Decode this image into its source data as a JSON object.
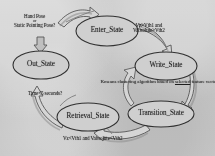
{
  "diagram": {
    "states": [
      {
        "id": "enter",
        "label": "Enter_State",
        "cx": 107,
        "cy": 31,
        "rx": 31,
        "ry": 15
      },
      {
        "id": "write",
        "label": "Write_State",
        "cx": 166,
        "cy": 66,
        "rx": 31,
        "ry": 14
      },
      {
        "id": "transition",
        "label": "Transition_State",
        "cx": 161,
        "cy": 114,
        "rx": 33,
        "ry": 13
      },
      {
        "id": "retrieval",
        "label": "Retrieval_State",
        "cx": 88,
        "cy": 117,
        "rx": 31,
        "ry": 14
      },
      {
        "id": "out",
        "label": "Out_State",
        "cx": 41,
        "cy": 65,
        "rx": 28,
        "ry": 14
      }
    ],
    "conditions": [
      {
        "id": "hand-pose",
        "lines": [
          "Hand Pose",
          "or",
          "Static Pointing Pose?"
        ],
        "x": 14,
        "y": 14
      },
      {
        "id": "enter-to-write",
        "lines": [
          "Vz>Vth1 and",
          "Vabsolute>Vth2"
        ],
        "x": 133,
        "y": 23
      },
      {
        "id": "time-out",
        "lines": [
          "Time<5 seconds?"
        ],
        "x": 28,
        "y": 91
      },
      {
        "id": "back-to-out",
        "lines": [
          "Vz<Vth1 and Vabsolute<Vth2"
        ],
        "x": 63,
        "y": 136
      }
    ],
    "inner_note": {
      "id": "kmeans-note",
      "line1": "Kmeans clustering algorithm",
      "line2_pre": "based on ",
      "line2_underlined": "selected",
      "line2_post": " feature vectors",
      "x": 160,
      "y": 78
    },
    "colors": {
      "paper": "#c9c9c9",
      "ink": "#1a1a1a",
      "arrow_stroke": "#4a4a4a",
      "arrow_fill": "#d6d6d6",
      "arrow_shadow": "#6e6e6e",
      "ellipse_stroke": "#333333"
    }
  }
}
